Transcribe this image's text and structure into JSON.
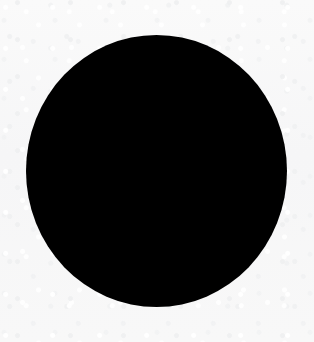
{
  "image": {
    "title": "Solid black disc on light paper background",
    "width": 314,
    "height": 342,
    "background_color": "#f7f7f7",
    "background_description": "near-white paper-like surface with faint scan grain",
    "border": "none",
    "text_content": "none"
  },
  "shapes": [
    {
      "id": "black-disc",
      "kind": "ellipse",
      "label": "black filled disc",
      "fill_color": "#000000",
      "stroke_color": "none",
      "center_x": 156.5,
      "center_y": 171,
      "radius_x": 130.5,
      "radius_y": 136,
      "left": 26,
      "right": 287,
      "top": 35,
      "bottom": 307,
      "width": 261,
      "height": 272,
      "edge_quality": "slightly rough, non-antialiased scan edge"
    }
  ],
  "chart_data": {
    "type": "pie",
    "title": "",
    "subtitle": "",
    "xlabel": "",
    "ylabel": "",
    "grid": false,
    "legend_position": "none",
    "categories": [
      "filled"
    ],
    "values": [
      100
    ],
    "colors": [
      "#000000"
    ],
    "annotations": [],
    "tick_labels": []
  }
}
